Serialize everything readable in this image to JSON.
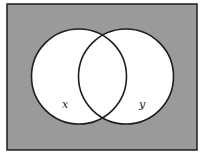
{
  "diagram": {
    "type": "venn",
    "universe": {
      "x": 7,
      "y": 4,
      "width": 190,
      "height": 146,
      "fill": "#9a9a9a",
      "stroke": "#1e1e1e"
    },
    "sets": [
      {
        "label": "x",
        "cx": 79,
        "cy": 76.5,
        "r": 47.5,
        "fill": "#ffffff",
        "label_x": 65,
        "label_y": 108
      },
      {
        "label": "y",
        "cx": 126,
        "cy": 76.5,
        "r": 47.5,
        "fill": "#ffffff",
        "label_x": 142,
        "label_y": 108
      }
    ],
    "stroke_color": "#1e1e1e",
    "shaded_region": "complement of (x ∪ y)"
  }
}
